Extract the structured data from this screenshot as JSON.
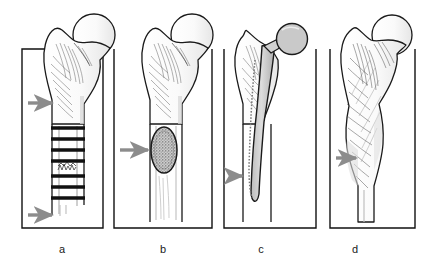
{
  "figure": {
    "panel_count": 4,
    "background_color": "#ffffff",
    "frame_color": "#111111",
    "arrow_color": "#8c8c8c",
    "bone_outline_color": "#1a1a1a",
    "bone_fill_color": "#ffffff",
    "implant_fill_color": "#cfcfcf",
    "lesion_fill_color": "#b5b5b5"
  },
  "panels": [
    {
      "id": "a",
      "label": "a",
      "finding": "laminated onion-skin periosteal reaction of femoral diaphysis",
      "arrow_count": 2,
      "arrows": [
        "upper-arrow-pointing-to-metaphysis",
        "lower-arrow-pointing-to-distal-periosteal-reaction"
      ],
      "feature_name": "periosteal-lamellation-ladder"
    },
    {
      "id": "b",
      "label": "b",
      "finding": "well-defined oval lytic lesion in proximal femoral shaft",
      "arrow_count": 1,
      "arrows": [
        "arrow-pointing-to-lytic-lesion"
      ],
      "feature_name": "oval-lytic-lesion"
    },
    {
      "id": "c",
      "label": "c",
      "finding": "femoral stem hip prosthesis in situ with lucency along stem",
      "arrow_count": 1,
      "arrows": [
        "arrow-pointing-to-distal-stem-lucency"
      ],
      "feature_name": "hip-prosthesis-stem"
    },
    {
      "id": "d",
      "label": "d",
      "finding": "expanded coarsened trabecular bone with cortical thickening",
      "arrow_count": 1,
      "arrows": [
        "arrow-pointing-to-expanded-cortex"
      ],
      "feature_name": "bone-expansion-coarse-trabeculae"
    }
  ],
  "labels": {
    "a": "a",
    "b": "b",
    "c": "c",
    "d": "d"
  }
}
